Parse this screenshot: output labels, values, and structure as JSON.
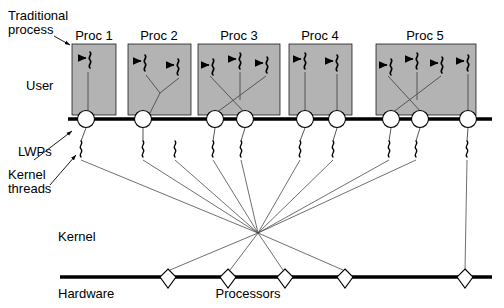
{
  "diagram": {
    "labels": {
      "traditional_process_line1": "Traditional",
      "traditional_process_line2": "process",
      "user": "User",
      "lwps": "LWPs",
      "kernel_threads_line1": "Kernel",
      "kernel_threads_line2": "threads",
      "kernel": "Kernel",
      "hardware": "Hardware",
      "processors": "Processors"
    },
    "colors": {
      "process_box_fill": "#b3b3b3",
      "process_box_stroke": "#000000",
      "bar_stroke": "#000000",
      "node_fill": "#ffffff",
      "line_stroke": "#3a3a3a",
      "background": "#ffffff",
      "text": "#000000"
    },
    "processes": [
      {
        "name": "Proc 1",
        "x": 72,
        "y": 44,
        "w": 44,
        "h": 71,
        "label_x": 94,
        "label_y": 40,
        "threads": 1,
        "lwps": 1
      },
      {
        "name": "Proc 2",
        "x": 128,
        "y": 44,
        "w": 63,
        "h": 71,
        "label_x": 159,
        "label_y": 40,
        "threads": 2,
        "lwps": 1
      },
      {
        "name": "Proc 3",
        "x": 198,
        "y": 44,
        "w": 82,
        "h": 71,
        "label_x": 239,
        "label_y": 40,
        "threads": 3,
        "lwps": 2
      },
      {
        "name": "Proc 4",
        "x": 289,
        "y": 44,
        "w": 63,
        "h": 71,
        "label_x": 320,
        "label_y": 40,
        "threads": 2,
        "lwps": 2
      },
      {
        "name": "Proc 5",
        "x": 376,
        "y": 44,
        "w": 100,
        "h": 71,
        "label_x": 425,
        "label_y": 40,
        "threads": 4,
        "lwps": 3
      }
    ],
    "user_threads": [
      {
        "proc": "Proc 1",
        "x": 88,
        "y": 62
      },
      {
        "proc": "Proc 2",
        "x": 146,
        "y": 62
      },
      {
        "proc": "Proc 2",
        "x": 179,
        "y": 66
      },
      {
        "proc": "Proc 3",
        "x": 214,
        "y": 66
      },
      {
        "proc": "Proc 3",
        "x": 240,
        "y": 60
      },
      {
        "proc": "Proc 3",
        "x": 268,
        "y": 64
      },
      {
        "proc": "Proc 4",
        "x": 305,
        "y": 60
      },
      {
        "proc": "Proc 4",
        "x": 337,
        "y": 62
      },
      {
        "proc": "Proc 5",
        "x": 391,
        "y": 66
      },
      {
        "proc": "Proc 5",
        "x": 417,
        "y": 60
      },
      {
        "proc": "Proc 5",
        "x": 443,
        "y": 62
      },
      {
        "proc": "Proc 5",
        "x": 468,
        "y": 62
      }
    ],
    "lwp_nodes": [
      {
        "x": 86,
        "y": 119,
        "r": 8.5
      },
      {
        "x": 143,
        "y": 119,
        "r": 8.5
      },
      {
        "x": 215,
        "y": 119,
        "r": 8.5
      },
      {
        "x": 245,
        "y": 119,
        "r": 8.5
      },
      {
        "x": 305,
        "y": 119,
        "r": 8.5
      },
      {
        "x": 337,
        "y": 119,
        "r": 8.5
      },
      {
        "x": 391,
        "y": 119,
        "r": 8.5
      },
      {
        "x": 420,
        "y": 119,
        "r": 8.5
      },
      {
        "x": 468,
        "y": 119,
        "r": 8.5
      }
    ],
    "kernel_thread_marks": [
      {
        "x": 80,
        "y": 146
      },
      {
        "x": 143,
        "y": 146
      },
      {
        "x": 174,
        "y": 146
      },
      {
        "x": 212,
        "y": 146
      },
      {
        "x": 240,
        "y": 146
      },
      {
        "x": 299,
        "y": 146
      },
      {
        "x": 332,
        "y": 146
      },
      {
        "x": 388,
        "y": 146
      },
      {
        "x": 415,
        "y": 146
      },
      {
        "x": 466,
        "y": 146
      }
    ],
    "convergence_point": {
      "x": 258,
      "y": 233
    },
    "processors": [
      {
        "x": 168,
        "y": 277
      },
      {
        "x": 228,
        "y": 277
      },
      {
        "x": 285,
        "y": 277
      },
      {
        "x": 345,
        "y": 277
      },
      {
        "x": 465,
        "y": 277
      }
    ],
    "bars": {
      "user_kernel_bar": {
        "x1": 68,
        "x2": 492,
        "y": 119
      },
      "hardware_bar": {
        "x1": 60,
        "x2": 492,
        "y": 277
      }
    },
    "annotations": [
      {
        "name": "traditional-process-leader",
        "from_x": 54,
        "from_y": 36,
        "to_x": 70,
        "to_y": 44
      },
      {
        "name": "lwps-leader",
        "from_x": 34,
        "from_y": 158,
        "to_x": 72,
        "to_y": 128
      },
      {
        "name": "kernel-threads-leader",
        "from_x": 50,
        "from_y": 183,
        "to_x": 76,
        "to_y": 152
      }
    ]
  }
}
